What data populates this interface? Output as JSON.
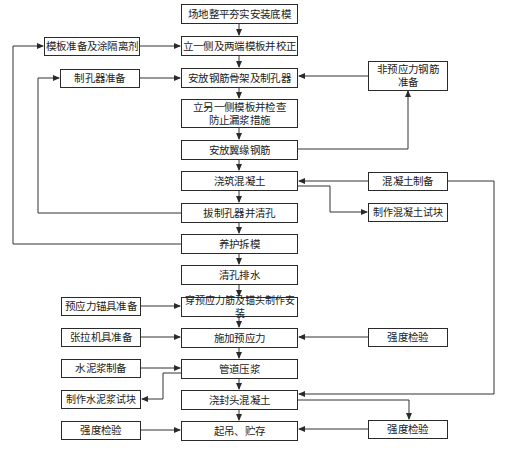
{
  "diagram": {
    "type": "flowchart",
    "main_steps": [
      {
        "id": "s1",
        "label": "场地整平夯实安装底模"
      },
      {
        "id": "s2",
        "label": "立一侧及两端模板并校正"
      },
      {
        "id": "s3",
        "label": "安放钢筋骨架及制孔器"
      },
      {
        "id": "s4",
        "label": "立另一侧模板并检查\n防止漏浆措施"
      },
      {
        "id": "s5",
        "label": "安放翼缘钢筋"
      },
      {
        "id": "s6",
        "label": "浇筑混凝土"
      },
      {
        "id": "s7",
        "label": "拔制孔器并清孔"
      },
      {
        "id": "s8",
        "label": "养护拆模"
      },
      {
        "id": "s9",
        "label": "清孔排水"
      },
      {
        "id": "s10",
        "label": "穿预应力筋及锚头制作安装"
      },
      {
        "id": "s11",
        "label": "施加预应力"
      },
      {
        "id": "s12",
        "label": "管道压浆"
      },
      {
        "id": "s13",
        "label": "浇封头混凝土"
      },
      {
        "id": "s14",
        "label": "起吊、贮存"
      }
    ],
    "left_steps": [
      {
        "id": "l1",
        "label": "模板准备及涂隔离剂"
      },
      {
        "id": "l2",
        "label": "制孔器准备"
      },
      {
        "id": "l3",
        "label": "预应力锚具准备"
      },
      {
        "id": "l4",
        "label": "张拉机具准备"
      },
      {
        "id": "l5",
        "label": "水泥浆制备"
      },
      {
        "id": "l6",
        "label": "制作水泥浆试块"
      },
      {
        "id": "l7",
        "label": "强度检验"
      }
    ],
    "right_steps": [
      {
        "id": "r1",
        "label": "非预应力钢筋\n准备"
      },
      {
        "id": "r2",
        "label": "混凝土制备"
      },
      {
        "id": "r3",
        "label": "制作混凝土试块"
      },
      {
        "id": "r4",
        "label": "强度检验"
      },
      {
        "id": "r5",
        "label": "强度检验"
      }
    ],
    "edges": [
      [
        "s1",
        "s2"
      ],
      [
        "s2",
        "s3"
      ],
      [
        "s3",
        "s4"
      ],
      [
        "s4",
        "s5"
      ],
      [
        "s5",
        "s6"
      ],
      [
        "s6",
        "s7"
      ],
      [
        "s7",
        "s8"
      ],
      [
        "s8",
        "s9"
      ],
      [
        "s9",
        "s10"
      ],
      [
        "s10",
        "s11"
      ],
      [
        "s11",
        "s12"
      ],
      [
        "s12",
        "s13"
      ],
      [
        "s13",
        "s14"
      ],
      [
        "l1",
        "s2"
      ],
      [
        "l2",
        "s3"
      ],
      [
        "s7",
        "l2"
      ],
      [
        "s8",
        "l1"
      ],
      [
        "r1",
        "s3"
      ],
      [
        "s5",
        "r1"
      ],
      [
        "r2",
        "s6"
      ],
      [
        "s6",
        "r3"
      ],
      [
        "r2",
        "s13"
      ],
      [
        "l3",
        "s10"
      ],
      [
        "l4",
        "s11"
      ],
      [
        "r4",
        "s11"
      ],
      [
        "l5",
        "s12"
      ],
      [
        "s12",
        "l6"
      ],
      [
        "l7",
        "s14"
      ],
      [
        "s13",
        "r5"
      ],
      [
        "r5",
        "s14"
      ]
    ]
  }
}
